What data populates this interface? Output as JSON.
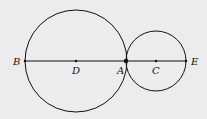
{
  "diagram": {
    "type": "geometry",
    "background": "#ececec",
    "stroke": "#111111",
    "circles": [
      {
        "name": "large-circle",
        "center": "D",
        "cx": 76,
        "cy": 61,
        "r": 51
      },
      {
        "name": "small-circle",
        "center": "C",
        "cx": 156,
        "cy": 61,
        "r": 30
      }
    ],
    "segment": {
      "from": "B",
      "to": "E",
      "x1": 25,
      "x2": 186,
      "y": 61
    },
    "points": [
      {
        "label": "B",
        "x": 25,
        "y": 61,
        "lx": 13,
        "ly": 65
      },
      {
        "label": "D",
        "x": 76,
        "y": 61,
        "lx": 72,
        "ly": 74
      },
      {
        "label": "A",
        "x": 126,
        "y": 61,
        "lx": 117,
        "ly": 74
      },
      {
        "label": "C",
        "x": 156,
        "y": 61,
        "lx": 152,
        "ly": 74
      },
      {
        "label": "E",
        "x": 186,
        "y": 61,
        "lx": 191,
        "ly": 65
      }
    ]
  }
}
